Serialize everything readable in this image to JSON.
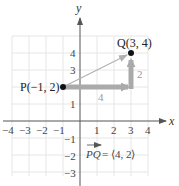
{
  "diagram": {
    "axes": {
      "x_label": "x",
      "y_label": "y",
      "x_ticks": [
        "−4",
        "−3",
        "−2",
        "−1",
        "1",
        "2",
        "3",
        "4"
      ],
      "y_ticks": [
        "4",
        "3",
        "1",
        "−1",
        "−2",
        "−3"
      ]
    },
    "points": {
      "P": {
        "label": "P(−1, 2)",
        "x": -1,
        "y": 2
      },
      "Q": {
        "label": "Q(3, 4)",
        "x": 3,
        "y": 4
      }
    },
    "components": {
      "horizontal_label": "4",
      "vertical_label": "2"
    },
    "vector_equation": {
      "name": "PQ",
      "equals": " = ⟨4, 2⟩"
    },
    "colors": {
      "grid": "#e6e6e6",
      "axis": "#555555",
      "component_arrow": "#aaaaaa",
      "vector_arrow": "#b0b0b0",
      "point": "#111111"
    }
  }
}
